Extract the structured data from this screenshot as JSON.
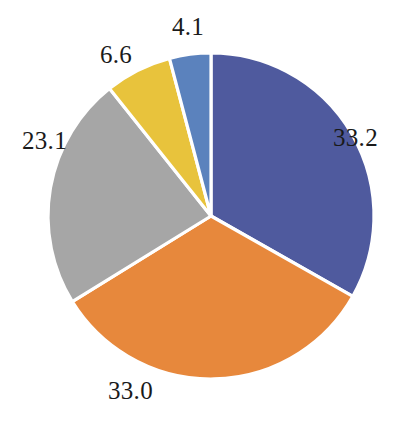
{
  "chart_data": {
    "type": "pie",
    "title": "",
    "subtitle": "",
    "xlabel": "",
    "ylabel": "",
    "legend_position": "none",
    "grid": false,
    "start_angle_deg": 0,
    "direction": "clockwise",
    "total": 100.0,
    "categories": [
      "33.2",
      "33.0",
      "23.1",
      "6.6",
      "4.1"
    ],
    "values": [
      33.2,
      33.0,
      23.1,
      6.6,
      4.1
    ],
    "colors": [
      "#4f5a9e",
      "#e7883c",
      "#a6a6a6",
      "#e8c33c",
      "#5b82bd"
    ],
    "slices": [
      {
        "label": "33.2",
        "value": 33.2,
        "color": "#4f5a9e",
        "color_name": "dark-blue"
      },
      {
        "label": "33.0",
        "value": 33.0,
        "color": "#e7883c",
        "color_name": "orange"
      },
      {
        "label": "23.1",
        "value": 23.1,
        "color": "#a6a6a6",
        "color_name": "gray"
      },
      {
        "label": "6.6",
        "value": 6.6,
        "color": "#e8c33c",
        "color_name": "yellow"
      },
      {
        "label": "4.1",
        "value": 4.1,
        "color": "#5b82bd",
        "color_name": "light-blue"
      }
    ],
    "labels": [
      "33.2",
      "33.0",
      "23.1",
      "6.6",
      "4.1"
    ],
    "separator_color": "#ffffff",
    "background_color": "#ffffff",
    "label_text_color": "#1a1a1a"
  }
}
